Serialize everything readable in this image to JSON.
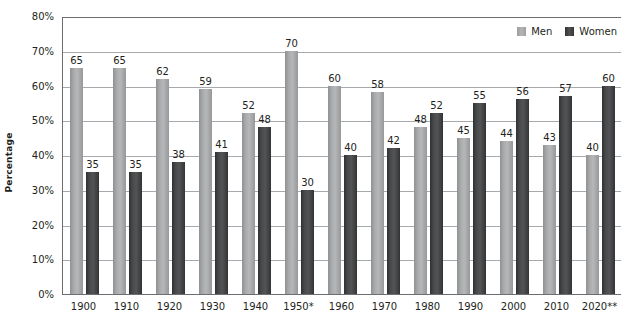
{
  "chart_data": {
    "type": "bar",
    "title": "",
    "subtitle": "",
    "xlabel": "",
    "ylabel": "Percentage",
    "categories": [
      "1900",
      "1910",
      "1920",
      "1930",
      "1940",
      "1950*",
      "1960",
      "1970",
      "1980",
      "1990",
      "2000",
      "2010",
      "2020**"
    ],
    "series": [
      {
        "name": "Men",
        "color": "#b0b1b3",
        "values": [
          65,
          65,
          62,
          59,
          52,
          70,
          60,
          58,
          48,
          45,
          44,
          43,
          40
        ]
      },
      {
        "name": "Women",
        "color": "#47484a",
        "values": [
          35,
          35,
          38,
          41,
          48,
          30,
          40,
          42,
          52,
          55,
          56,
          57,
          60
        ]
      }
    ],
    "ylim": [
      0,
      80
    ],
    "ytick_values": [
      0,
      10,
      20,
      30,
      40,
      50,
      60,
      70,
      80
    ],
    "ytick_labels": [
      "0%",
      "10%",
      "20%",
      "30%",
      "40%",
      "50%",
      "60%",
      "70%",
      "80%"
    ],
    "grid": true,
    "legend_position": "top-right",
    "data_labels": true,
    "annotations": []
  },
  "legend": {
    "items": [
      {
        "label": "Men",
        "swatch": "men-swatch"
      },
      {
        "label": "Women",
        "swatch": "women-swatch"
      }
    ]
  },
  "axes": {
    "y_title": "Percentage"
  }
}
